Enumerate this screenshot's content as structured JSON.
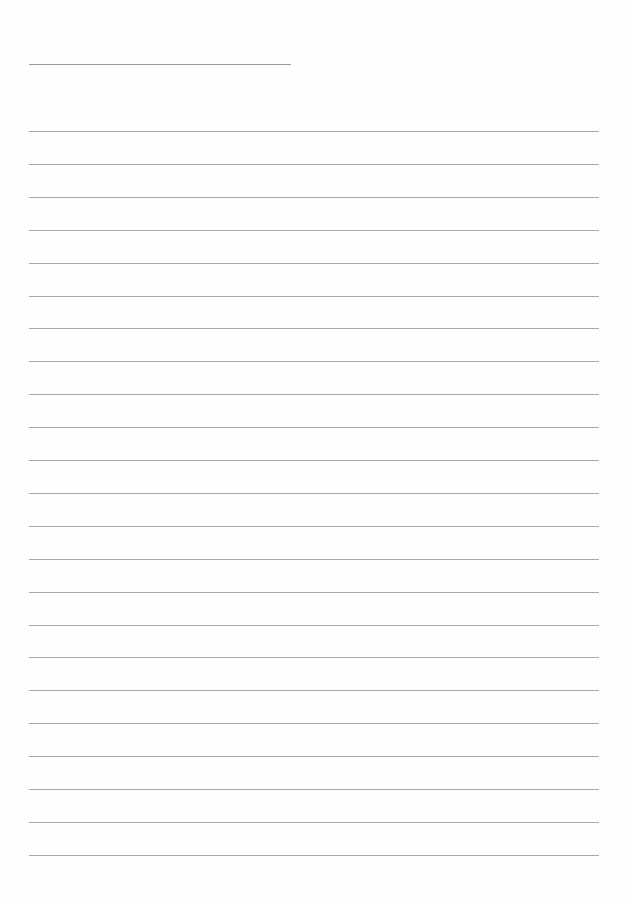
{
  "document": {
    "type": "lined-paper",
    "title_line": {
      "text": ""
    },
    "rule_count": 23,
    "rules": [
      "",
      "",
      "",
      "",
      "",
      "",
      "",
      "",
      "",
      "",
      "",
      "",
      "",
      "",
      "",
      "",
      "",
      "",
      "",
      "",
      "",
      "",
      ""
    ]
  },
  "colors": {
    "paper": "#fefefe",
    "rule": "#a8a8a8"
  }
}
